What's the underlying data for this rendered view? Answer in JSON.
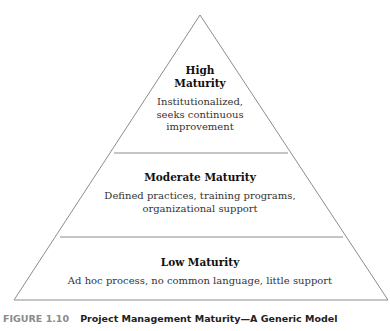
{
  "pyramid": {
    "levels": [
      {
        "title_line1": "High",
        "title_line2": "Maturity",
        "desc_line1": "Institutionalized,",
        "desc_line2": "seeks continuous",
        "desc_line3": "improvement"
      },
      {
        "title": "Moderate Maturity",
        "desc_line1": "Defined practices, training programs,",
        "desc_line2": "organizational support"
      },
      {
        "title": "Low Maturity",
        "desc_line1": "Ad hoc process, no common language, little support"
      }
    ],
    "line_color": "#8c8c8c"
  },
  "caption": {
    "number": "FIGURE 1.10",
    "text": "Project Management Maturity—A Generic Model"
  }
}
